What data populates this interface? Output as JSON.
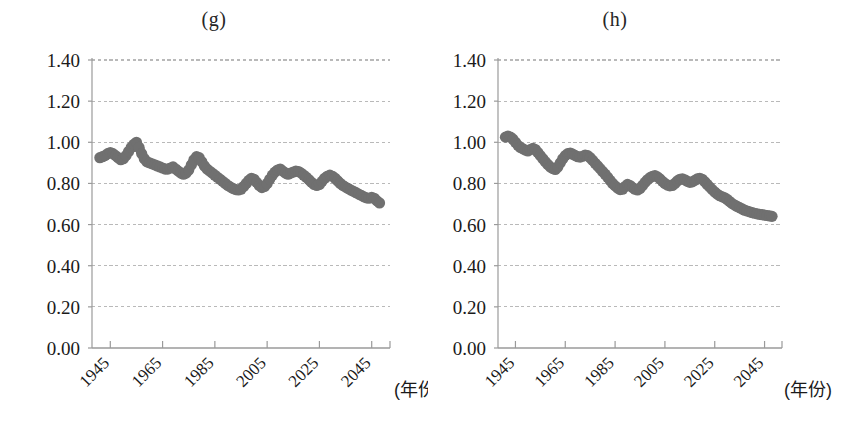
{
  "figure": {
    "background": "#ffffff",
    "marker_color": "#707070",
    "axis_color": "#9a9a9a",
    "grid_color": "#b9b9b9",
    "text_color": "#1a1a1a"
  },
  "panels": [
    {
      "id": "g",
      "title": "(g)",
      "x_unit_label": "(年份)"
    },
    {
      "id": "h",
      "title": "(h)",
      "x_unit_label": "(年份)"
    }
  ],
  "chart_data": [
    {
      "type": "scatter",
      "title": "(g)",
      "xlabel": "(年份)",
      "ylabel": "",
      "xlim": [
        1938,
        2052
      ],
      "ylim": [
        0.0,
        1.4
      ],
      "yticks": [
        "0.00",
        "0.20",
        "0.40",
        "0.60",
        "0.80",
        "1.00",
        "1.20",
        "1.40"
      ],
      "ytick_values": [
        0.0,
        0.2,
        0.4,
        0.6,
        0.8,
        1.0,
        1.2,
        1.4
      ],
      "xticks": [
        "1945",
        "1965",
        "1985",
        "2005",
        "2025",
        "2045"
      ],
      "xtick_values": [
        1945,
        1965,
        1985,
        2005,
        2025,
        2045
      ],
      "grid": "horizontal-dashed",
      "legend": "none",
      "x": [
        1941,
        1942,
        1943,
        1944,
        1945,
        1946,
        1947,
        1948,
        1949,
        1950,
        1951,
        1952,
        1953,
        1954,
        1955,
        1956,
        1957,
        1958,
        1959,
        1960,
        1961,
        1962,
        1963,
        1964,
        1965,
        1966,
        1967,
        1968,
        1969,
        1970,
        1971,
        1972,
        1973,
        1974,
        1975,
        1976,
        1977,
        1978,
        1979,
        1980,
        1981,
        1982,
        1983,
        1984,
        1985,
        1986,
        1987,
        1988,
        1989,
        1990,
        1991,
        1992,
        1993,
        1994,
        1995,
        1996,
        1997,
        1998,
        1999,
        2000,
        2001,
        2002,
        2003,
        2004,
        2005,
        2006,
        2007,
        2008,
        2009,
        2010,
        2011,
        2012,
        2013,
        2014,
        2015,
        2016,
        2017,
        2018,
        2019,
        2020,
        2021,
        2022,
        2023,
        2024,
        2025,
        2026,
        2027,
        2028,
        2029,
        2030,
        2031,
        2032,
        2033,
        2034,
        2035,
        2036,
        2037,
        2038,
        2039,
        2040,
        2041,
        2042,
        2043,
        2044,
        2045,
        2046,
        2047,
        2048
      ],
      "y": [
        0.925,
        0.93,
        0.935,
        0.945,
        0.95,
        0.945,
        0.935,
        0.925,
        0.915,
        0.92,
        0.935,
        0.955,
        0.975,
        0.99,
        1.0,
        0.975,
        0.945,
        0.92,
        0.905,
        0.9,
        0.895,
        0.89,
        0.885,
        0.88,
        0.875,
        0.87,
        0.87,
        0.875,
        0.88,
        0.87,
        0.86,
        0.85,
        0.845,
        0.85,
        0.865,
        0.89,
        0.915,
        0.93,
        0.925,
        0.905,
        0.885,
        0.87,
        0.86,
        0.85,
        0.84,
        0.83,
        0.82,
        0.81,
        0.8,
        0.79,
        0.782,
        0.775,
        0.77,
        0.768,
        0.772,
        0.785,
        0.8,
        0.815,
        0.825,
        0.82,
        0.805,
        0.79,
        0.78,
        0.785,
        0.8,
        0.82,
        0.84,
        0.855,
        0.865,
        0.87,
        0.86,
        0.85,
        0.845,
        0.85,
        0.855,
        0.86,
        0.858,
        0.85,
        0.84,
        0.83,
        0.818,
        0.805,
        0.795,
        0.79,
        0.795,
        0.81,
        0.825,
        0.835,
        0.84,
        0.835,
        0.825,
        0.812,
        0.8,
        0.79,
        0.782,
        0.775,
        0.768,
        0.762,
        0.755,
        0.748,
        0.742,
        0.735,
        0.73,
        0.728,
        0.732,
        0.728,
        0.715,
        0.705
      ]
    },
    {
      "type": "scatter",
      "title": "(h)",
      "xlabel": "(年份)",
      "ylabel": "",
      "xlim": [
        1938,
        2052
      ],
      "ylim": [
        0.0,
        1.4
      ],
      "yticks": [
        "0.00",
        "0.20",
        "0.40",
        "0.60",
        "0.80",
        "1.00",
        "1.20",
        "1.40"
      ],
      "ytick_values": [
        0.0,
        0.2,
        0.4,
        0.6,
        0.8,
        1.0,
        1.2,
        1.4
      ],
      "xticks": [
        "1945",
        "1965",
        "1985",
        "2005",
        "2025",
        "2045"
      ],
      "xtick_values": [
        1945,
        1965,
        1985,
        2005,
        2025,
        2045
      ],
      "grid": "horizontal-dashed",
      "legend": "none",
      "x": [
        1941,
        1942,
        1943,
        1944,
        1945,
        1946,
        1947,
        1948,
        1949,
        1950,
        1951,
        1952,
        1953,
        1954,
        1955,
        1956,
        1957,
        1958,
        1959,
        1960,
        1961,
        1962,
        1963,
        1964,
        1965,
        1966,
        1967,
        1968,
        1969,
        1970,
        1971,
        1972,
        1973,
        1974,
        1975,
        1976,
        1977,
        1978,
        1979,
        1980,
        1981,
        1982,
        1983,
        1984,
        1985,
        1986,
        1987,
        1988,
        1989,
        1990,
        1991,
        1992,
        1993,
        1994,
        1995,
        1996,
        1997,
        1998,
        1999,
        2000,
        2001,
        2002,
        2003,
        2004,
        2005,
        2006,
        2007,
        2008,
        2009,
        2010,
        2011,
        2012,
        2013,
        2014,
        2015,
        2016,
        2017,
        2018,
        2019,
        2020,
        2021,
        2022,
        2023,
        2024,
        2025,
        2026,
        2027,
        2028,
        2029,
        2030,
        2031,
        2032,
        2033,
        2034,
        2035,
        2036,
        2037,
        2038,
        2039,
        2040,
        2041,
        2042,
        2043,
        2044,
        2045,
        2046,
        2047,
        2048
      ],
      "y": [
        1.025,
        1.03,
        1.025,
        1.015,
        1.0,
        0.985,
        0.975,
        0.968,
        0.962,
        0.958,
        0.965,
        0.97,
        0.965,
        0.95,
        0.935,
        0.92,
        0.905,
        0.892,
        0.88,
        0.872,
        0.868,
        0.88,
        0.9,
        0.92,
        0.935,
        0.945,
        0.948,
        0.942,
        0.935,
        0.93,
        0.928,
        0.932,
        0.938,
        0.935,
        0.925,
        0.912,
        0.898,
        0.885,
        0.872,
        0.858,
        0.845,
        0.83,
        0.815,
        0.8,
        0.788,
        0.778,
        0.77,
        0.772,
        0.785,
        0.795,
        0.79,
        0.78,
        0.772,
        0.768,
        0.775,
        0.79,
        0.805,
        0.818,
        0.828,
        0.835,
        0.838,
        0.832,
        0.822,
        0.81,
        0.8,
        0.792,
        0.788,
        0.79,
        0.8,
        0.812,
        0.82,
        0.822,
        0.818,
        0.81,
        0.805,
        0.808,
        0.815,
        0.822,
        0.825,
        0.82,
        0.808,
        0.795,
        0.782,
        0.77,
        0.758,
        0.748,
        0.74,
        0.735,
        0.73,
        0.722,
        0.712,
        0.702,
        0.695,
        0.688,
        0.682,
        0.676,
        0.67,
        0.666,
        0.662,
        0.658,
        0.655,
        0.652,
        0.65,
        0.648,
        0.646,
        0.644,
        0.642,
        0.64
      ]
    }
  ]
}
